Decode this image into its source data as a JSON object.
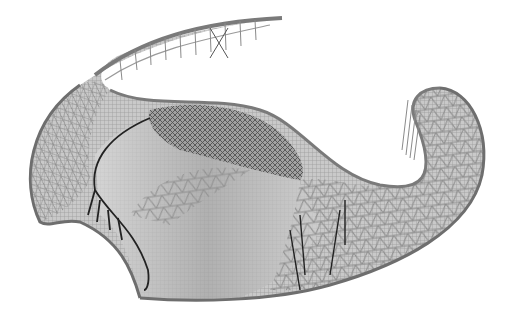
{
  "image": {
    "subject": "lattice shell structure rendering",
    "width": 508,
    "height": 317,
    "colors": {
      "background": "#ffffff",
      "edge_beam": "#6e6e6e",
      "grid_light": "#9a9a9a",
      "grid_mid": "#7c7c7c",
      "grid_dark": "#3a3a3a",
      "shade_fill": "#b5b5b5",
      "dense_fill": "#8c8c8c",
      "column": "#222222"
    }
  }
}
